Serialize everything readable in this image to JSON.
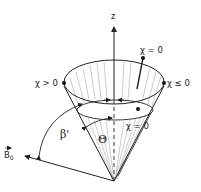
{
  "figure": {
    "type": "cone-diagram",
    "axis_label": "z",
    "vector_label": "B",
    "vector_subscript": "0",
    "angle_labels": {
      "beta": "β'",
      "theta": "Θ"
    },
    "points": [
      {
        "label": "χ = 0",
        "position": "top-rim-back"
      },
      {
        "label": "χ > 0",
        "position": "rim-left"
      },
      {
        "label": "χ ≤ 0",
        "position": "rim-right"
      },
      {
        "label": "χ = 0",
        "position": "inner-rim-front"
      }
    ],
    "colors": {
      "stroke": "#222222",
      "hatch": "#888888",
      "background": "#ffffff"
    }
  }
}
